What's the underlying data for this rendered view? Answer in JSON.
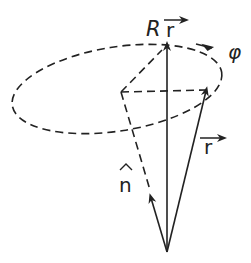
{
  "diagram": {
    "labels": {
      "rotated_vector": "R",
      "rotated_vector_sub": "r",
      "angle": "φ",
      "vector": "r",
      "axis": "n"
    },
    "colors": {
      "stroke": "#222222",
      "background": "#ffffff"
    }
  }
}
